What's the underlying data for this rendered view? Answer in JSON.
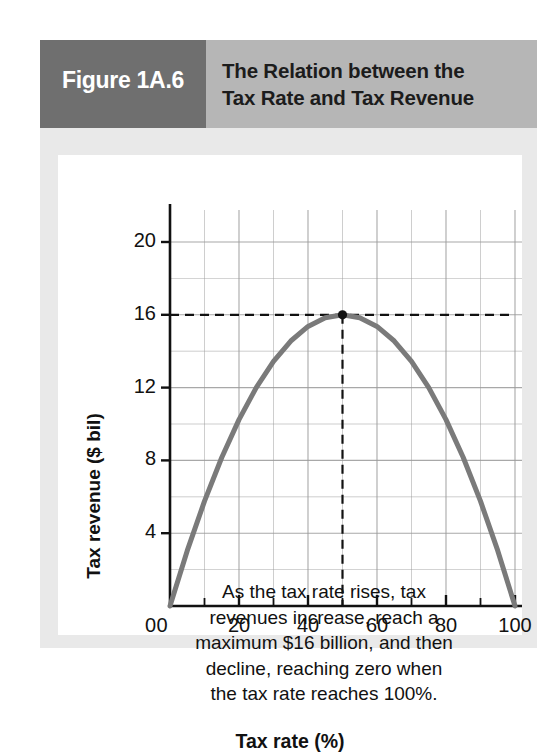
{
  "figure": {
    "number_label": "Figure 1A.6",
    "title_line1": "The Relation between the",
    "title_line2": "Tax Rate and Tax Revenue",
    "header_dark_color": "#6f6f6f",
    "header_light_color": "#b6b6b6",
    "panel_color": "#ffffff",
    "frame_color": "#e9e9e9"
  },
  "annotation": {
    "line1": "As the tax rate rises, tax",
    "line2": "revenues increase, reach a",
    "line3": "maximum $16 billion, and then",
    "line4": "decline, reaching zero when",
    "line5": "the tax rate reaches 100%."
  },
  "chart_data": {
    "type": "line",
    "title": "The Relation between the Tax Rate and Tax Revenue",
    "xlabel": "Tax rate (%)",
    "ylabel": "Tax revenue ($ bil)",
    "xlim": [
      0,
      115
    ],
    "ylim": [
      0,
      22
    ],
    "x_major_ticks": [
      0,
      20,
      40,
      60,
      80,
      100
    ],
    "x_major_tick_labels": [
      "0",
      "20",
      "40",
      "60",
      "80",
      "100"
    ],
    "x_minor_ticks": [
      10,
      30,
      50,
      70,
      90,
      110
    ],
    "y_major_ticks": [
      0,
      4,
      8,
      12,
      16,
      20
    ],
    "y_major_tick_labels": [
      "0",
      "4",
      "8",
      "12",
      "16",
      "20"
    ],
    "y_minor_ticks": [
      2,
      6,
      10,
      14,
      18,
      22
    ],
    "grid": true,
    "grid_color": "#9a9a9a",
    "curve_color": "#7a7a7a",
    "curve_width": 5,
    "legend": "none",
    "series": [
      {
        "name": "Tax revenue (Laffer curve)",
        "x": [
          0,
          5,
          10,
          15,
          20,
          25,
          30,
          35,
          40,
          45,
          50,
          55,
          60,
          65,
          70,
          75,
          80,
          85,
          90,
          95,
          100
        ],
        "values": [
          0,
          3.04,
          5.76,
          8.16,
          10.24,
          12.0,
          13.44,
          14.56,
          15.36,
          15.84,
          16.0,
          15.84,
          15.36,
          14.56,
          13.44,
          12.0,
          10.24,
          8.16,
          5.76,
          3.04,
          0
        ]
      }
    ],
    "annotations": [
      {
        "name": "peak-point",
        "x": 50,
        "y": 16,
        "marker": "dot",
        "color": "#111111"
      },
      {
        "name": "peak-horizontal-dashed",
        "from": [
          0,
          16
        ],
        "to": [
          100,
          16
        ],
        "style": "dashed"
      },
      {
        "name": "peak-vertical-dashed",
        "from": [
          50,
          0
        ],
        "to": [
          50,
          16
        ],
        "style": "dashed"
      }
    ],
    "max_revenue_value": 16,
    "max_revenue_rate": 50,
    "zero_revenue_rates": [
      0,
      100
    ]
  }
}
